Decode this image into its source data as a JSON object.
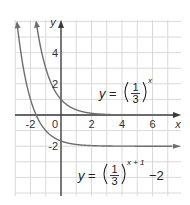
{
  "chart_data": {
    "type": "line",
    "title": "",
    "xlabel": "x",
    "ylabel": "y",
    "xlim": [
      -3,
      7.5
    ],
    "ylim": [
      -5,
      6
    ],
    "grid": true,
    "x_ticks": [
      -2,
      0,
      2,
      4,
      6
    ],
    "y_ticks": [
      4,
      2,
      -2
    ],
    "x_tick_labels": [
      "-2",
      "0",
      "2",
      "4",
      "6"
    ],
    "y_tick_labels": [
      "4",
      "2",
      "-2"
    ],
    "origin_label": "0",
    "series": [
      {
        "name": "y = (1/3)^x",
        "formula": "(1/3)^x",
        "label_base": "y = ",
        "label_num": "1",
        "label_den": "3",
        "label_exp": "x",
        "label_tail": "",
        "asymptote": 0,
        "points": [
          [
            -1.63,
            6
          ],
          [
            -1.5,
            5.2
          ],
          [
            -1,
            3
          ],
          [
            -0.5,
            1.73
          ],
          [
            0,
            1
          ],
          [
            0.5,
            0.58
          ],
          [
            1,
            0.33
          ],
          [
            2,
            0.11
          ],
          [
            3,
            0.04
          ],
          [
            4,
            0.01
          ],
          [
            7.5,
            0
          ]
        ]
      },
      {
        "name": "y = (1/3)^(x+1) - 2",
        "formula": "(1/3)^(x+1) - 2",
        "label_base": "y = ",
        "label_num": "1",
        "label_den": "3",
        "label_exp": "x + 1",
        "label_tail": "−2",
        "asymptote": -2,
        "points": [
          [
            -3.07,
            6
          ],
          [
            -3,
            7
          ],
          [
            -2.5,
            3.2
          ],
          [
            -2,
            1
          ],
          [
            -1.5,
            -0.27
          ],
          [
            -1,
            -1
          ],
          [
            0,
            -1.67
          ],
          [
            1,
            -1.89
          ],
          [
            2,
            -1.96
          ],
          [
            3,
            -1.99
          ],
          [
            7.5,
            -2
          ]
        ]
      }
    ]
  },
  "colors": {
    "grid": "#d9d9d9",
    "axis": "#3a3a3a",
    "curve": "#6e6e6e",
    "text": "#333333"
  }
}
